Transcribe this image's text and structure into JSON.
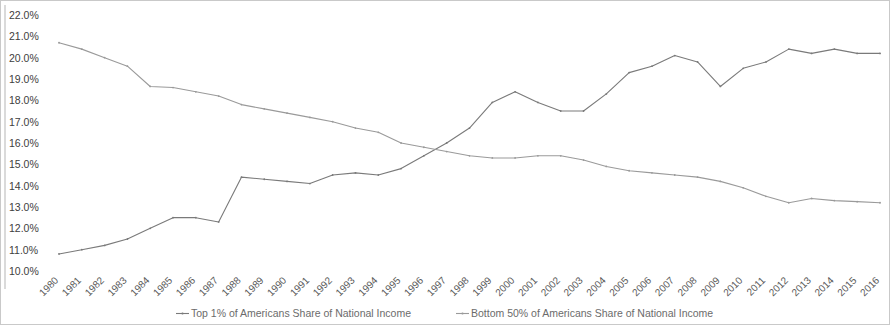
{
  "chart_data": {
    "type": "line",
    "title": "",
    "xlabel": "",
    "ylabel": "",
    "ylim": [
      10.0,
      22.0
    ],
    "ytick_step": 1.0,
    "ytick_labels": [
      "22.0%",
      "21.0%",
      "20.0%",
      "19.0%",
      "18.0%",
      "17.0%",
      "16.0%",
      "15.0%",
      "14.0%",
      "13.0%",
      "12.0%",
      "11.0%",
      "10.0%"
    ],
    "ytick_values": [
      22.0,
      21.0,
      20.0,
      19.0,
      18.0,
      17.0,
      16.0,
      15.0,
      14.0,
      13.0,
      12.0,
      11.0,
      10.0
    ],
    "grid": false,
    "legend_position": "bottom",
    "categories": [
      "1980",
      "1981",
      "1982",
      "1983",
      "1984",
      "1985",
      "1986",
      "1987",
      "1988",
      "1989",
      "1990",
      "1991",
      "1992",
      "1993",
      "1994",
      "1995",
      "1996",
      "1997",
      "1998",
      "1999",
      "2000",
      "2001",
      "2002",
      "2003",
      "2004",
      "2005",
      "2006",
      "2007",
      "2008",
      "2009",
      "2010",
      "2011",
      "2012",
      "2013",
      "2014",
      "2015",
      "2016"
    ],
    "series": [
      {
        "name": "Top 1% of Americans Share of National Income",
        "color": "#7a7a7a",
        "values": [
          10.8,
          11.0,
          11.2,
          11.5,
          12.0,
          12.5,
          12.5,
          12.3,
          14.4,
          14.3,
          14.2,
          14.1,
          14.5,
          14.6,
          14.5,
          14.8,
          15.4,
          16.0,
          16.7,
          17.9,
          18.4,
          17.9,
          17.5,
          17.5,
          18.3,
          19.3,
          19.6,
          20.1,
          19.8,
          18.65,
          19.5,
          19.8,
          20.4,
          20.2,
          20.4,
          20.2,
          20.2
        ]
      },
      {
        "name": "Bottom 50% of Americans Share of National Income",
        "color": "#9a9a9a",
        "values": [
          20.7,
          20.4,
          20.0,
          19.6,
          18.65,
          18.6,
          18.4,
          18.2,
          17.8,
          17.6,
          17.4,
          17.2,
          17.0,
          16.7,
          16.5,
          16.0,
          15.8,
          15.6,
          15.4,
          15.3,
          15.3,
          15.4,
          15.4,
          15.2,
          14.9,
          14.7,
          14.6,
          14.5,
          14.4,
          14.2,
          13.9,
          13.5,
          13.2,
          13.4,
          13.3,
          13.25,
          13.2
        ]
      }
    ]
  },
  "legend": {
    "items": [
      {
        "label": "Top 1% of Americans Share of National Income",
        "color": "#7a7a7a",
        "marker": "dash-line-marker"
      },
      {
        "label": "Bottom 50% of Americans Share of National Income",
        "color": "#9a9a9a",
        "marker": "dash-line-marker"
      }
    ]
  }
}
